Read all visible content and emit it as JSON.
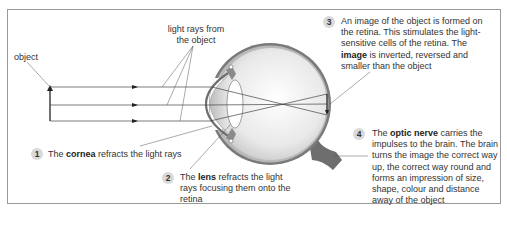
{
  "labels": {
    "object": "object",
    "light_rays_line1": "light rays from",
    "light_rays_line2": "the object"
  },
  "callouts": [
    {
      "number": "1",
      "pre": "The ",
      "bold": "cornea",
      "post": " refracts the light rays"
    },
    {
      "number": "2",
      "pre": "The ",
      "bold": "lens",
      "post": " refracts the light rays focusing them onto the retina",
      "lines": [
        "The |lens| refracts the light",
        "rays focusing them onto",
        "the retina"
      ]
    },
    {
      "number": "3",
      "pre": "An image of the object is formed on the retina. This stimulates the light-sensitive cells of the retina. The ",
      "bold": "image",
      "post": " is inverted, reversed and smaller than the object",
      "lines": [
        "An image of the object is formed",
        "on the retina. This stimulates the",
        "light-sensitive cells of the retina.",
        "The |image| is inverted, reversed",
        "and smaller than the object"
      ]
    },
    {
      "number": "4",
      "pre": "The ",
      "bold": "optic nerve",
      "post": " carries the impulses to the brain. The brain turns the image the correct way up, the correct way round and forms an impression of size, shape, colour and distance away of the object",
      "lines": [
        "The |optic nerve| carries the",
        "impulses to the brain. The brain",
        "turns the image the correct way",
        "up, the correct way round and",
        "forms an impression of size,",
        "shape, colour and distance",
        "away of the object"
      ]
    }
  ],
  "colors": {
    "frame_border": "#9a9a9a",
    "badge_fill": "#d9d9d9",
    "eye_outer": "#7a7a7a",
    "eye_inner": "#e6e6e6",
    "text": "#333333"
  }
}
